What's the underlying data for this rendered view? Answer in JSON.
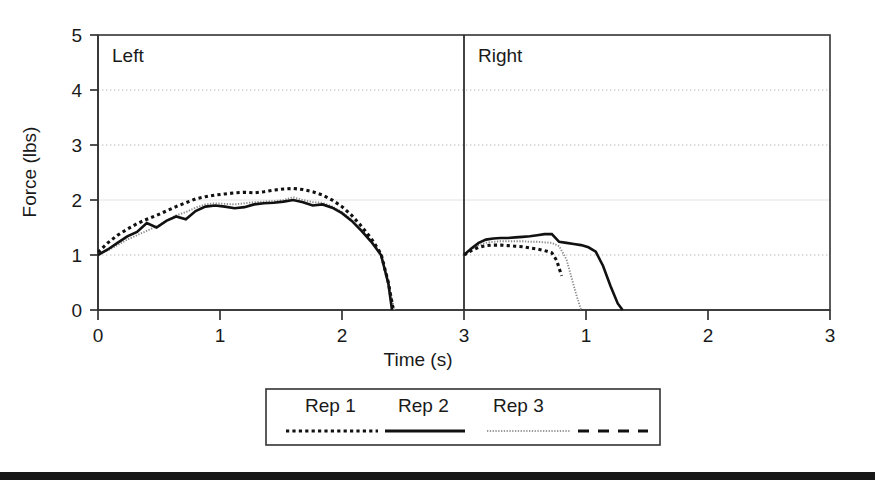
{
  "chart_data": {
    "type": "line",
    "title": "",
    "xlabel": "Time (s)",
    "ylabel": "Force (lbs)",
    "xlim": [
      0,
      3
    ],
    "ylim": [
      0,
      5
    ],
    "xticks": [
      0,
      1,
      2,
      3
    ],
    "yticks": [
      0,
      1,
      2,
      3,
      4,
      5
    ],
    "xtick_labels": [
      "0",
      "1",
      "2",
      "3"
    ],
    "ytick_labels": [
      "0",
      "1",
      "2",
      "3",
      "4",
      "5"
    ],
    "grid": true,
    "grid_axis": "y",
    "grid_style": "dotted",
    "legend_position": "below-plot",
    "panels": [
      {
        "name": "left",
        "label": "Left",
        "xticks": [
          0,
          1,
          2,
          3
        ],
        "xtick_labels": [
          "0",
          "1",
          "2",
          "3"
        ],
        "series": [
          {
            "name": "Rep 1",
            "style": "dotted-bold",
            "x": [
              0.0,
              0.08,
              0.16,
              0.24,
              0.32,
              0.4,
              0.48,
              0.56,
              0.64,
              0.72,
              0.8,
              0.88,
              0.96,
              1.04,
              1.12,
              1.2,
              1.28,
              1.36,
              1.44,
              1.52,
              1.6,
              1.68,
              1.76,
              1.84,
              1.92,
              2.0,
              2.08,
              2.16,
              2.24,
              2.32,
              2.38,
              2.42
            ],
            "y": [
              1.05,
              1.22,
              1.36,
              1.47,
              1.57,
              1.65,
              1.72,
              1.8,
              1.88,
              1.95,
              2.02,
              2.06,
              2.09,
              2.11,
              2.13,
              2.14,
              2.13,
              2.15,
              2.18,
              2.2,
              2.21,
              2.19,
              2.15,
              2.09,
              2.0,
              1.88,
              1.72,
              1.52,
              1.3,
              1.02,
              0.5,
              0.0
            ]
          },
          {
            "name": "Rep 2",
            "style": "solid",
            "x": [
              0.0,
              0.08,
              0.16,
              0.24,
              0.32,
              0.4,
              0.48,
              0.56,
              0.64,
              0.72,
              0.8,
              0.88,
              0.96,
              1.04,
              1.12,
              1.2,
              1.28,
              1.36,
              1.44,
              1.52,
              1.6,
              1.68,
              1.76,
              1.84,
              1.92,
              2.0,
              2.08,
              2.16,
              2.24,
              2.32,
              2.38,
              2.41
            ],
            "y": [
              1.0,
              1.1,
              1.22,
              1.34,
              1.42,
              1.58,
              1.5,
              1.62,
              1.7,
              1.65,
              1.8,
              1.88,
              1.9,
              1.88,
              1.85,
              1.87,
              1.92,
              1.94,
              1.95,
              1.97,
              2.0,
              1.96,
              1.9,
              1.92,
              1.86,
              1.76,
              1.62,
              1.44,
              1.24,
              1.0,
              0.48,
              0.0
            ]
          },
          {
            "name": "Rep 3",
            "style": "dotted-fine",
            "x": [
              0.0,
              0.08,
              0.16,
              0.24,
              0.32,
              0.4,
              0.48,
              0.56,
              0.64,
              0.72,
              0.8,
              0.88,
              0.96,
              1.04,
              1.12,
              1.2,
              1.28,
              1.36,
              1.44,
              1.52,
              1.6,
              1.68,
              1.76,
              1.84,
              1.92,
              2.0,
              2.08,
              2.16,
              2.24,
              2.32,
              2.38,
              2.43
            ],
            "y": [
              1.02,
              1.08,
              1.18,
              1.28,
              1.36,
              1.44,
              1.52,
              1.62,
              1.72,
              1.78,
              1.86,
              1.92,
              1.94,
              1.93,
              1.92,
              1.94,
              1.96,
              1.97,
              1.98,
              2.0,
              2.05,
              2.0,
              1.96,
              1.95,
              1.88,
              1.78,
              1.64,
              1.46,
              1.26,
              1.02,
              0.5,
              0.0
            ]
          }
        ]
      },
      {
        "name": "right",
        "label": "Right",
        "xticks": [
          0,
          1,
          2,
          3
        ],
        "xtick_labels": [
          "3",
          "1",
          "2",
          "3"
        ],
        "series": [
          {
            "name": "Rep 1",
            "style": "dotted-bold",
            "x": [
              0.0,
              0.06,
              0.12,
              0.18,
              0.24,
              0.3,
              0.36,
              0.42,
              0.48,
              0.54,
              0.6,
              0.66,
              0.72,
              0.76,
              0.8
            ],
            "y": [
              1.0,
              1.08,
              1.14,
              1.17,
              1.18,
              1.18,
              1.17,
              1.16,
              1.15,
              1.13,
              1.11,
              1.08,
              1.04,
              0.9,
              0.62
            ]
          },
          {
            "name": "Rep 2",
            "style": "solid",
            "x": [
              0.0,
              0.06,
              0.12,
              0.18,
              0.24,
              0.3,
              0.36,
              0.42,
              0.48,
              0.54,
              0.6,
              0.66,
              0.72,
              0.78,
              0.84,
              0.9,
              0.96,
              1.02,
              1.08,
              1.14,
              1.2,
              1.26,
              1.3
            ],
            "y": [
              1.0,
              1.12,
              1.22,
              1.28,
              1.3,
              1.31,
              1.31,
              1.32,
              1.33,
              1.34,
              1.36,
              1.38,
              1.38,
              1.24,
              1.22,
              1.2,
              1.18,
              1.14,
              1.06,
              0.8,
              0.44,
              0.12,
              0.0
            ]
          },
          {
            "name": "Rep 3",
            "style": "dotted-fine",
            "x": [
              0.0,
              0.06,
              0.12,
              0.18,
              0.24,
              0.3,
              0.36,
              0.42,
              0.48,
              0.54,
              0.6,
              0.66,
              0.72,
              0.78,
              0.84,
              0.88,
              0.92,
              0.96
            ],
            "y": [
              1.0,
              1.1,
              1.18,
              1.22,
              1.24,
              1.25,
              1.25,
              1.25,
              1.25,
              1.24,
              1.24,
              1.23,
              1.22,
              1.16,
              0.92,
              0.6,
              0.28,
              0.0
            ]
          }
        ]
      }
    ],
    "legend": {
      "entries": [
        {
          "label": "Rep 1",
          "style": "dotted-bold"
        },
        {
          "label": "Rep 2",
          "style": "solid"
        },
        {
          "label": "Rep 3",
          "style": "dotted-fine"
        },
        {
          "label": "",
          "style": "dashed"
        }
      ]
    }
  },
  "colors": {
    "line": "#111111",
    "rep3_line": "#8d8d8d",
    "frame": "#333333",
    "grid": "#b8b8b8",
    "background": "#ffffff",
    "footer_bar": "#171717"
  }
}
